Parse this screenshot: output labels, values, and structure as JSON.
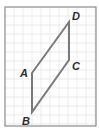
{
  "figure": {
    "type": "parallelogram-on-grid",
    "frame": {
      "x": 5,
      "y": 7,
      "width": 91,
      "height": 119,
      "stroke": "#8a8a8a"
    },
    "grid": {
      "spacing": 9,
      "color": "#e6e6e6"
    },
    "shape": {
      "stroke": "#7a7a7a",
      "stroke_width": 2,
      "vertices": [
        {
          "name": "A",
          "x": 32,
          "y": 73
        },
        {
          "name": "B",
          "x": 32,
          "y": 112
        },
        {
          "name": "C",
          "x": 69,
          "y": 60
        },
        {
          "name": "D",
          "x": 69,
          "y": 22
        }
      ],
      "edges": [
        [
          "A",
          "D"
        ],
        [
          "D",
          "C"
        ],
        [
          "C",
          "B"
        ],
        [
          "B",
          "A"
        ]
      ]
    },
    "labels": [
      {
        "text": "A",
        "x": 20,
        "y": 77
      },
      {
        "text": "B",
        "x": 22,
        "y": 125
      },
      {
        "text": "C",
        "x": 72,
        "y": 70
      },
      {
        "text": "D",
        "x": 72,
        "y": 20
      }
    ]
  }
}
